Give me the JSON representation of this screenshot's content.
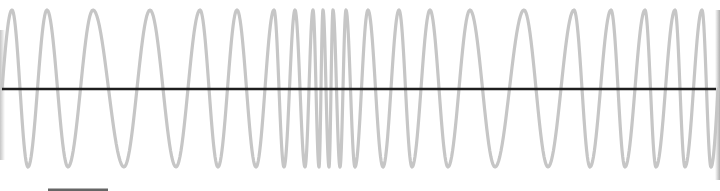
{
  "figure": {
    "wave_color": "#c6c6c6",
    "axis_color": "#1e1e1e",
    "scale_bar_color": "#666666",
    "baseline_y": 89,
    "amplitude_top_y": 10,
    "amplitude_bottom_y": 167,
    "extrema_x": [
      2,
      12,
      28,
      47,
      68,
      93,
      124,
      150,
      176,
      200,
      218,
      237,
      256,
      274,
      284,
      295,
      305,
      313,
      319,
      323,
      329,
      333,
      340,
      346,
      355,
      368,
      383,
      399,
      412,
      430,
      448,
      470,
      495,
      524,
      548,
      574,
      590,
      611,
      625,
      645,
      656,
      675,
      685,
      702,
      711,
      718
    ],
    "scale_bar": {
      "x1": 48,
      "x2": 108,
      "y": 190
    }
  }
}
